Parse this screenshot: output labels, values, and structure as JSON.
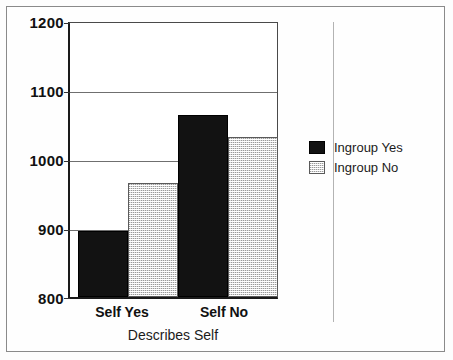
{
  "chart_data": {
    "type": "bar",
    "title": "",
    "xlabel": "Describes Self",
    "ylabel": "",
    "categories": [
      "Self Yes",
      "Self No"
    ],
    "series": [
      {
        "name": "Ingroup Yes",
        "values": [
          896,
          1066
        ],
        "color": "#121212",
        "fill": "solid"
      },
      {
        "name": "Ingroup No",
        "values": [
          967,
          1033
        ],
        "color": "#dcdcdc",
        "fill": "dotted"
      }
    ],
    "ylim": [
      800,
      1200
    ],
    "yticks": [
      800,
      900,
      1000,
      1100,
      1200
    ],
    "ytick_labels": [
      "800",
      "900",
      "1000",
      "1100",
      "1200"
    ],
    "grid": true,
    "legend_position": "right"
  },
  "axis": {
    "y_labels": [
      "1200",
      "1100",
      "1000",
      "900",
      "800"
    ],
    "x_labels": [
      "Self Yes",
      "Self No"
    ],
    "x_title": "Describes Self"
  },
  "legend": {
    "entries": [
      {
        "label": "Ingroup Yes"
      },
      {
        "label": "Ingroup No"
      }
    ]
  }
}
